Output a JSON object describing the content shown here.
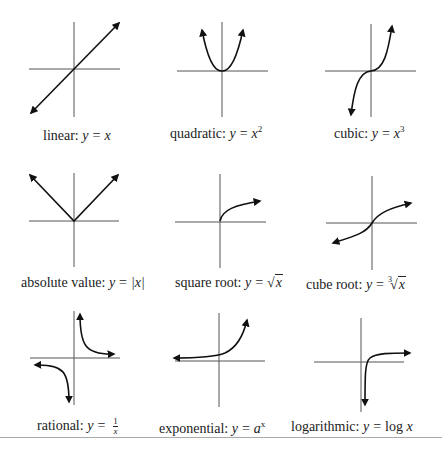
{
  "colors": {
    "axis": "#555555",
    "curve": "#111111",
    "text": "#222222",
    "separator": "#aaaaaa"
  },
  "graphs": [
    {
      "id": "linear",
      "name": "linear:",
      "equation_lhs": "y",
      "equation_op": "=",
      "equation_rhs": "x",
      "superscript": ""
    },
    {
      "id": "quadratic",
      "name": "quadratic:",
      "equation_lhs": "y",
      "equation_op": "=",
      "equation_rhs": "x",
      "superscript": "2"
    },
    {
      "id": "cubic",
      "name": "cubic:",
      "equation_lhs": "y",
      "equation_op": "=",
      "equation_rhs": "x",
      "superscript": "3"
    },
    {
      "id": "absolute-value",
      "name": "absolute value:",
      "equation_lhs": "y",
      "equation_op": "=",
      "equation_rhs": "|x|",
      "superscript": ""
    },
    {
      "id": "square-root",
      "name": "square root:",
      "equation_lhs": "y",
      "equation_op": "=",
      "radical_symbol": "√",
      "radicand": "x"
    },
    {
      "id": "cube-root",
      "name": "cube root:",
      "equation_lhs": "y",
      "equation_op": "=",
      "radical_index": "3",
      "radical_symbol": "√",
      "radicand": "x"
    },
    {
      "id": "rational",
      "name": "rational:",
      "equation_lhs": "y",
      "equation_op": "=",
      "numerator": "1",
      "denominator": "x"
    },
    {
      "id": "exponential",
      "name": "exponential:",
      "equation_lhs": "y",
      "equation_op": "=",
      "equation_rhs": "a",
      "superscript": "x"
    },
    {
      "id": "logarithmic",
      "name": "logarithmic:",
      "equation_lhs": "y",
      "equation_op": "=",
      "log_fn": "log",
      "equation_rhs": "x"
    }
  ]
}
